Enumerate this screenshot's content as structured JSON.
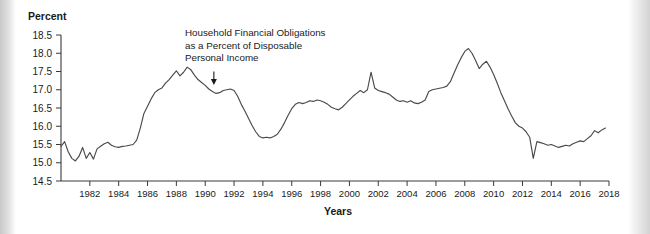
{
  "chart_data": {
    "type": "line",
    "title": "",
    "ylabel": "Percent",
    "xlabel": "Years",
    "ylim": [
      14.5,
      18.5
    ],
    "xlim": [
      1980,
      2018
    ],
    "grid": false,
    "legend": null,
    "annotations": [
      {
        "name": "series-annotation",
        "lines": [
          "Household Financial Obligations",
          "as a Percent of Disposable",
          "Personal Income"
        ],
        "points_to_year": 1990.6,
        "points_to_value": 17.02
      }
    ],
    "ytick_labels": [
      "18.5",
      "18.0",
      "17.5",
      "17.0",
      "16.5",
      "16.0",
      "15.5",
      "15.0",
      "14.5"
    ],
    "ytick_values": [
      18.5,
      18.0,
      17.5,
      17.0,
      16.5,
      16.0,
      15.5,
      15.0,
      14.5
    ],
    "xtick_labels": [
      "1982",
      "1984",
      "1986",
      "1988",
      "1990",
      "1992",
      "1994",
      "1996",
      "1998",
      "2000",
      "2002",
      "2004",
      "2006",
      "2008",
      "2010",
      "2012",
      "2014",
      "2016",
      "2018"
    ],
    "xtick_values": [
      1982,
      1984,
      1986,
      1988,
      1990,
      1992,
      1994,
      1996,
      1998,
      2000,
      2002,
      2004,
      2006,
      2008,
      2010,
      2012,
      2014,
      2016,
      2018
    ],
    "series": [
      {
        "name": "Household Financial Obligations as a Percent of Disposable Personal Income",
        "color": "#4a4a4a",
        "x": [
          1980.0,
          1980.25,
          1980.5,
          1980.75,
          1981.0,
          1981.25,
          1981.5,
          1981.75,
          1982.0,
          1982.25,
          1982.5,
          1982.75,
          1983.0,
          1983.25,
          1983.5,
          1983.75,
          1984.0,
          1984.25,
          1984.5,
          1984.75,
          1985.0,
          1985.25,
          1985.5,
          1985.75,
          1986.0,
          1986.25,
          1986.5,
          1986.75,
          1987.0,
          1987.25,
          1987.5,
          1987.75,
          1988.0,
          1988.25,
          1988.5,
          1988.75,
          1989.0,
          1989.25,
          1989.5,
          1989.75,
          1990.0,
          1990.25,
          1990.5,
          1990.75,
          1991.0,
          1991.25,
          1991.5,
          1991.75,
          1992.0,
          1992.25,
          1992.5,
          1992.75,
          1993.0,
          1993.25,
          1993.5,
          1993.75,
          1994.0,
          1994.25,
          1994.5,
          1994.75,
          1995.0,
          1995.25,
          1995.5,
          1995.75,
          1996.0,
          1996.25,
          1996.5,
          1996.75,
          1997.0,
          1997.25,
          1997.5,
          1997.75,
          1998.0,
          1998.25,
          1998.5,
          1998.75,
          1999.0,
          1999.25,
          1999.5,
          1999.75,
          2000.0,
          2000.25,
          2000.5,
          2000.75,
          2001.0,
          2001.25,
          2001.5,
          2001.75,
          2002.0,
          2002.25,
          2002.5,
          2002.75,
          2003.0,
          2003.25,
          2003.5,
          2003.75,
          2004.0,
          2004.25,
          2004.5,
          2004.75,
          2005.0,
          2005.25,
          2005.5,
          2005.75,
          2006.0,
          2006.25,
          2006.5,
          2006.75,
          2007.0,
          2007.25,
          2007.5,
          2007.75,
          2008.0,
          2008.25,
          2008.5,
          2008.75,
          2009.0,
          2009.25,
          2009.5,
          2009.75,
          2010.0,
          2010.25,
          2010.5,
          2010.75,
          2011.0,
          2011.25,
          2011.5,
          2011.75,
          2012.0,
          2012.25,
          2012.5,
          2012.75,
          2013.0,
          2013.25,
          2013.5,
          2013.75,
          2014.0,
          2014.25,
          2014.5,
          2014.75,
          2015.0,
          2015.25,
          2015.5,
          2015.75,
          2016.0,
          2016.25,
          2016.5,
          2016.75,
          2017.0,
          2017.25,
          2017.5,
          2017.75
        ],
        "y": [
          15.45,
          15.58,
          15.3,
          15.12,
          15.05,
          15.18,
          15.42,
          15.12,
          15.28,
          15.1,
          15.38,
          15.45,
          15.52,
          15.56,
          15.48,
          15.44,
          15.42,
          15.45,
          15.46,
          15.48,
          15.5,
          15.62,
          15.95,
          16.35,
          16.55,
          16.75,
          16.92,
          17.0,
          17.05,
          17.18,
          17.28,
          17.4,
          17.52,
          17.38,
          17.48,
          17.62,
          17.55,
          17.4,
          17.28,
          17.2,
          17.12,
          17.02,
          16.95,
          16.9,
          16.92,
          16.98,
          17.0,
          17.02,
          16.98,
          16.82,
          16.6,
          16.42,
          16.22,
          16.02,
          15.85,
          15.72,
          15.68,
          15.7,
          15.68,
          15.72,
          15.78,
          15.92,
          16.1,
          16.3,
          16.48,
          16.6,
          16.65,
          16.62,
          16.65,
          16.7,
          16.68,
          16.72,
          16.7,
          16.66,
          16.6,
          16.52,
          16.48,
          16.45,
          16.52,
          16.62,
          16.72,
          16.82,
          16.9,
          16.98,
          16.92,
          17.0,
          17.48,
          17.05,
          16.98,
          16.95,
          16.92,
          16.88,
          16.8,
          16.72,
          16.68,
          16.7,
          16.66,
          16.7,
          16.64,
          16.62,
          16.66,
          16.72,
          16.95,
          17.0,
          17.02,
          17.04,
          17.06,
          17.1,
          17.22,
          17.45,
          17.68,
          17.88,
          18.05,
          18.13,
          18.0,
          17.8,
          17.58,
          17.7,
          17.78,
          17.62,
          17.42,
          17.18,
          16.92,
          16.7,
          16.48,
          16.28,
          16.1,
          16.0,
          15.95,
          15.85,
          15.7,
          15.12,
          15.58,
          15.55,
          15.52,
          15.48,
          15.5,
          15.46,
          15.42,
          15.45,
          15.48,
          15.46,
          15.52,
          15.56,
          15.6,
          15.58,
          15.66,
          15.74,
          15.88,
          15.82,
          15.9,
          15.95
        ]
      }
    ]
  }
}
